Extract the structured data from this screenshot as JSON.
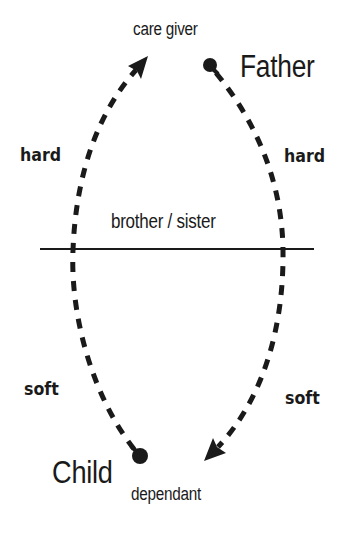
{
  "diagram": {
    "top_label": "care giver",
    "top_node": "Father",
    "bottom_node": "Child",
    "bottom_label": "dependant",
    "divider_label": "brother / sister",
    "left_upper_label": "hard",
    "right_upper_label": "hard",
    "left_lower_label": "soft",
    "right_lower_label": "soft",
    "edges": [
      {
        "from": "Child",
        "to": "care giver",
        "style": "dashed",
        "side": "left",
        "arrow": "end"
      },
      {
        "from": "Father",
        "to": "dependant",
        "style": "dashed",
        "side": "right",
        "arrow": "end"
      }
    ],
    "colors": {
      "stroke": "#1a1a1a",
      "background": "#ffffff"
    }
  }
}
